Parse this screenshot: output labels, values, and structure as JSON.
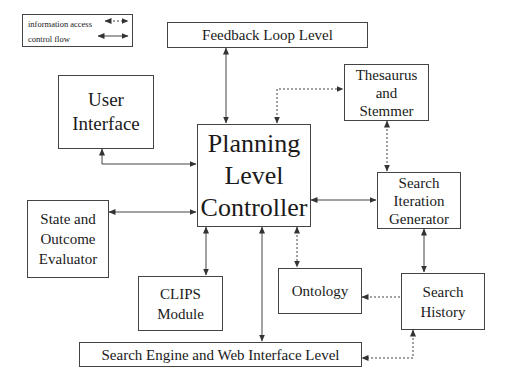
{
  "legend": {
    "items": [
      {
        "label": "information access",
        "style": "dashed"
      },
      {
        "label": "control flow",
        "style": "solid"
      }
    ]
  },
  "nodes": {
    "feedback": {
      "label": "Feedback Loop Level"
    },
    "thesaurus": {
      "label": "Thesaurus\nand\nStemmer"
    },
    "user_interface": {
      "label": "User\nInterface"
    },
    "planning": {
      "label": "Planning\nLevel\nController"
    },
    "search_iteration": {
      "label": "Search\nIteration\nGenerator"
    },
    "state_outcome": {
      "label": "State and\nOutcome\nEvaluator"
    },
    "clips": {
      "label": "CLIPS\nModule"
    },
    "ontology": {
      "label": "Ontology"
    },
    "search_history": {
      "label": "Search\nHistory"
    },
    "search_engine": {
      "label": "Search Engine and Web Interface Level"
    }
  },
  "edges": [
    {
      "from": "feedback",
      "to": "planning",
      "type": "control flow"
    },
    {
      "from": "planning",
      "to": "thesaurus",
      "type": "information access"
    },
    {
      "from": "thesaurus",
      "to": "search_iteration",
      "type": "information access"
    },
    {
      "from": "user_interface",
      "to": "planning",
      "type": "control flow"
    },
    {
      "from": "state_outcome",
      "to": "planning",
      "type": "control flow"
    },
    {
      "from": "planning",
      "to": "search_iteration",
      "type": "control flow"
    },
    {
      "from": "planning",
      "to": "clips",
      "type": "control flow"
    },
    {
      "from": "planning",
      "to": "search_engine",
      "type": "control flow"
    },
    {
      "from": "planning",
      "to": "ontology",
      "type": "information access"
    },
    {
      "from": "search_iteration",
      "to": "search_history",
      "type": "control flow"
    },
    {
      "from": "search_history",
      "to": "ontology",
      "type": "information access"
    },
    {
      "from": "search_history",
      "to": "search_engine",
      "type": "information access"
    }
  ]
}
